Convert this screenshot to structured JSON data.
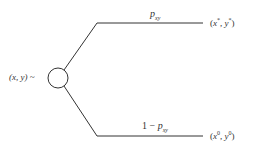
{
  "diagram": {
    "type": "lottery-tree",
    "root_label": "(x, y) ~",
    "upper_branch": {
      "prob_base": "p",
      "prob_sub": "xy",
      "outcome_base": "x",
      "outcome_sup": "*",
      "outcome_base2": "y",
      "outcome_sup2": "*"
    },
    "lower_branch": {
      "prob_prefix": "1 − ",
      "prob_base": "p",
      "prob_sub": "xy",
      "outcome_base": "x",
      "outcome_sup": "0",
      "outcome_base2": "y",
      "outcome_sup2": "0"
    },
    "colors": {
      "line": "#333333",
      "text": "#333333"
    }
  }
}
